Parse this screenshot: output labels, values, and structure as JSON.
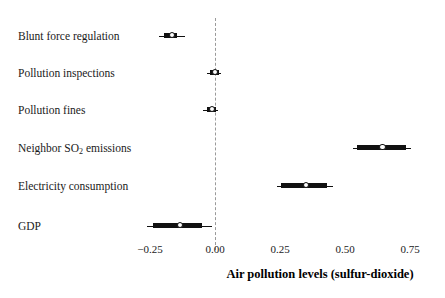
{
  "chart_data": {
    "type": "scatter",
    "subtype": "coefficient-forest-plot",
    "title": "",
    "xlabel": "Air pollution levels (sulfur-dioxide)",
    "ylabel": "",
    "xlim": [
      -0.33,
      0.79
    ],
    "xticks": [
      -0.25,
      0.0,
      0.25,
      0.5,
      0.75
    ],
    "xticklabels": [
      "−0.25",
      "0.00",
      "0.25",
      "0.50",
      "0.75"
    ],
    "grid": false,
    "legend": null,
    "reference_line": {
      "x": 0.0,
      "style": "dashed",
      "color": "#9a9a9a"
    },
    "categories": [
      "Blunt force regulation",
      "Pollution inspections",
      "Pollution fines",
      "Neighbor SO₂ emissions",
      "Electricity consumption",
      "GDP"
    ],
    "points": [
      {
        "label": "Blunt force regulation",
        "estimate": -0.165,
        "ci_inner_low": -0.195,
        "ci_inner_high": -0.145,
        "ci_outer_low": -0.215,
        "ci_outer_high": -0.115
      },
      {
        "label": "Pollution inspections",
        "estimate": 0.0,
        "ci_inner_low": -0.02,
        "ci_inner_high": 0.015,
        "ci_outer_low": -0.03,
        "ci_outer_high": 0.025
      },
      {
        "label": "Pollution fines",
        "estimate": -0.012,
        "ci_inner_low": -0.032,
        "ci_inner_high": 0.004,
        "ci_outer_low": -0.045,
        "ci_outer_high": 0.012
      },
      {
        "label": "Neighbor SO₂ emissions",
        "estimate": 0.645,
        "ci_inner_low": 0.545,
        "ci_inner_high": 0.735,
        "ci_outer_low": 0.53,
        "ci_outer_high": 0.755
      },
      {
        "label": "Electricity consumption",
        "estimate": 0.35,
        "ci_inner_low": 0.255,
        "ci_inner_high": 0.43,
        "ci_outer_low": 0.24,
        "ci_outer_high": 0.455
      },
      {
        "label": "GDP",
        "estimate": -0.135,
        "ci_inner_low": -0.24,
        "ci_inner_high": -0.05,
        "ci_outer_low": -0.26,
        "ci_outer_high": -0.01
      }
    ]
  },
  "labels": {
    "row0": "Blunt force regulation",
    "row1": "Pollution inspections",
    "row2": "Pollution fines",
    "row3_pre": "Neighbor SO",
    "row3_sub": "2",
    "row3_post": " emissions",
    "row4": "Electricity consumption",
    "row5": "GDP"
  },
  "axis": {
    "title": "Air pollution levels (sulfur-dioxide)",
    "tick0": "−0.25",
    "tick1": "0.00",
    "tick2": "0.25",
    "tick3": "0.50",
    "tick4": "0.75"
  },
  "colors": {
    "ink": "#111111",
    "reference": "#9a9a9a",
    "background": "#ffffff"
  }
}
